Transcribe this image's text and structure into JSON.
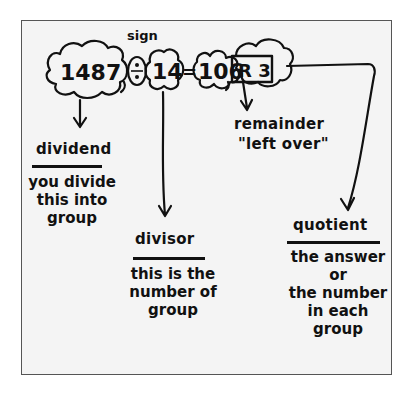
{
  "diagram": {
    "equation": {
      "dividend": "1487",
      "operator": "÷",
      "divisor": "14",
      "equals": "=",
      "quotient": "106",
      "remainder": "R 3"
    },
    "sign_label": "sign",
    "parts": [
      {
        "term": "dividend",
        "description": "you divide\nthis into\ngroup"
      },
      {
        "term": "divisor",
        "description": "this is the\nnumber of\ngroup"
      },
      {
        "term": "quotient",
        "description": "the answer\nor\nthe number\nin each\ngroup"
      }
    ],
    "remainder_note": {
      "term": "remainder",
      "description": "\"left over\""
    },
    "colors": {
      "ink": "#111111",
      "paper": "#f4f4f4",
      "frame": "#555555"
    }
  }
}
